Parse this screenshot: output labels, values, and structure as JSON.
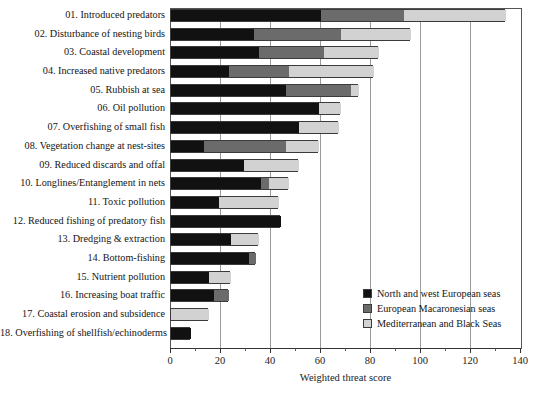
{
  "chart_data": {
    "type": "bar",
    "orientation": "horizontal",
    "stacked": true,
    "title": "",
    "xlabel": "Weighted threat score",
    "ylabel": "",
    "xlim": [
      0,
      140
    ],
    "xticks": [
      0,
      20,
      40,
      60,
      80,
      100,
      120,
      140
    ],
    "xtick_labels": [
      "0",
      "20",
      "40",
      "60",
      "80",
      "100",
      "120",
      "140"
    ],
    "grid": "vertical",
    "legend_position": "bottom-right",
    "categories": [
      "01. Introduced predators",
      "02. Disturbance of nesting birds",
      "03. Coastal development",
      "04. Increased native predators",
      "05. Rubbish at sea",
      "06. Oil pollution",
      "07. Overfishing of small fish",
      "08. Vegetation change at nest-sites",
      "09. Reduced discards and offal",
      "10. Longlines/Entanglement in nets",
      "11. Toxic pollution",
      "12. Reduced fishing of predatory fish",
      "13. Dredging & extraction",
      "14. Bottom-fishing",
      "15. Nutrient pollution",
      "16. Increasing boat traffic",
      "17. Coastal erosion and subsidence",
      "18. Overfishing of shellfish/echinoderms"
    ],
    "series": [
      {
        "name": "North and west European seas",
        "color": "#111111",
        "values": [
          60,
          33,
          35,
          23,
          46,
          59,
          51,
          13,
          29,
          36,
          19,
          44,
          24,
          31,
          15,
          17,
          0,
          8
        ]
      },
      {
        "name": "European Macaronesian seas",
        "color": "#6b6b6b",
        "values": [
          33,
          35,
          26,
          24,
          26,
          0,
          0,
          33,
          0,
          3,
          0,
          0,
          0,
          3,
          0,
          6,
          0,
          0
        ]
      },
      {
        "name": "Mediterranean and Black Seas",
        "color": "#d2d2d2",
        "values": [
          41,
          28,
          22,
          34,
          3,
          9,
          16,
          13,
          22,
          8,
          24,
          0,
          11,
          0,
          9,
          0,
          15,
          0
        ]
      }
    ],
    "totals": [
      134,
      96,
      83,
      81,
      75,
      68,
      67,
      59,
      51,
      47,
      43,
      44,
      35,
      34,
      24,
      23,
      15,
      8
    ]
  },
  "legend": {
    "entries": [
      {
        "label": "North and west European seas",
        "color": "#111111"
      },
      {
        "label": "European Macaronesian seas",
        "color": "#6b6b6b"
      },
      {
        "label": "Mediterranean and Black Seas",
        "color": "#d2d2d2"
      }
    ]
  }
}
